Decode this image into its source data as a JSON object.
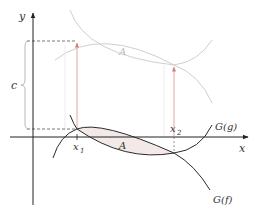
{
  "diagram": {
    "axes": {
      "x_label": "x",
      "y_label": "y"
    },
    "labels": {
      "x1": "x",
      "x1_sub": "1",
      "x2": "x",
      "x2_sub": "2",
      "area_lower": "A",
      "area_upper": "A",
      "shift": "c",
      "curve_g": "G(g)",
      "curve_f": "G(f)"
    },
    "colors": {
      "curve": "#2a2a2a",
      "faint_curve": "#c8c8c8",
      "arrow": "#d9a0a0",
      "shade": "#f3e9e9",
      "axis": "#222222",
      "dashed": "#555555",
      "brace": "#b0b0b0"
    }
  }
}
